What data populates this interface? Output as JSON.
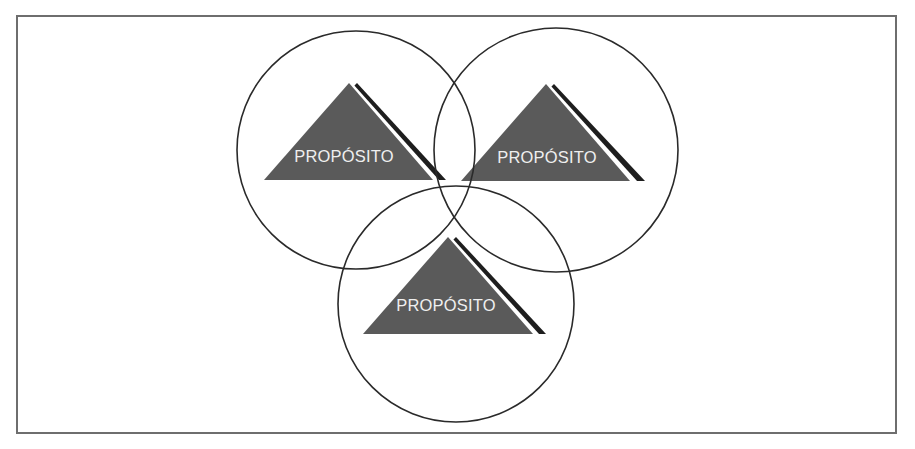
{
  "diagram": {
    "type": "venn-of-pyramids",
    "colors": {
      "frame": "#6e6e6e",
      "circle_stroke": "#2a2a2a",
      "triangle_fill": "#5a5a5a",
      "shadow_light": "#ffffff",
      "shadow_dark": "#1e1e1e",
      "label": "#efefef"
    },
    "circles": [
      {
        "id": "left",
        "cx": 356,
        "cy": 150,
        "r": 119
      },
      {
        "id": "right",
        "cx": 556,
        "cy": 150,
        "r": 122
      },
      {
        "id": "bottom",
        "cx": 456,
        "cy": 304,
        "r": 118
      }
    ],
    "pyramids": [
      {
        "id": "left",
        "label": "PROPÓSITO",
        "apex": [
          349,
          83
        ],
        "base_y": 180,
        "base_left": 264,
        "base_right": 433,
        "label_x": 344,
        "label_y": 162
      },
      {
        "id": "right",
        "label": "PROPÓSITO",
        "apex": [
          546,
          84
        ],
        "base_y": 181,
        "base_left": 461,
        "base_right": 630,
        "label_x": 547,
        "label_y": 163
      },
      {
        "id": "bottom",
        "label": "PROPÓSITO",
        "apex": [
          448,
          237
        ],
        "base_y": 334,
        "base_left": 363,
        "base_right": 533,
        "label_x": 446,
        "label_y": 311
      }
    ]
  }
}
